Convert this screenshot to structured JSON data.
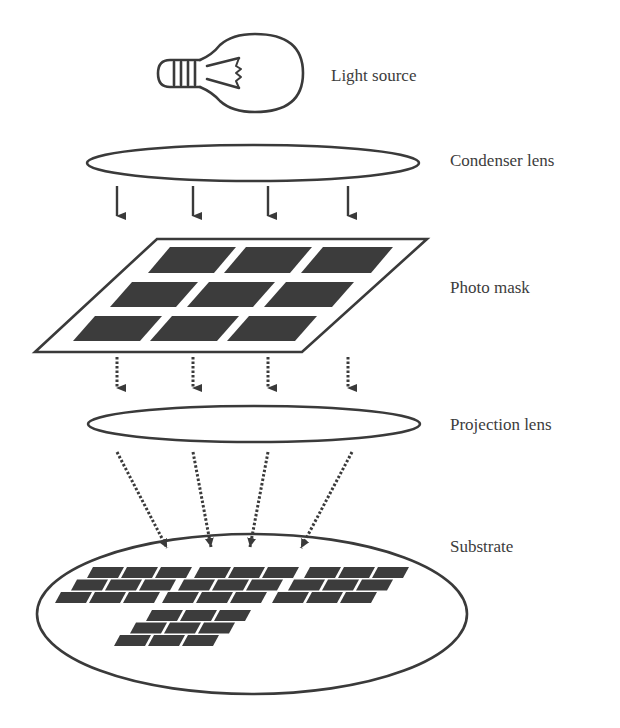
{
  "diagram": {
    "colors": {
      "stroke": "#3a3a3a",
      "die_fill": "#3c3c3c",
      "text": "#3c3c3c",
      "background": "#ffffff"
    },
    "components": [
      {
        "id": "light-source",
        "label": "Light source",
        "label_x": 331,
        "label_y": 67
      },
      {
        "id": "condenser-lens",
        "label": "Condenser lens",
        "label_x": 450,
        "label_y": 152
      },
      {
        "id": "photo-mask",
        "label": "Photo mask",
        "label_x": 450,
        "label_y": 279
      },
      {
        "id": "projection-lens",
        "label": "Projection lens",
        "label_x": 450,
        "label_y": 416
      },
      {
        "id": "substrate",
        "label": "Substrate",
        "label_x": 450,
        "label_y": 538
      }
    ],
    "condenser_lens": {
      "cx": 253,
      "cy": 163,
      "rx": 166,
      "ry": 18
    },
    "projection_lens": {
      "cx": 254,
      "cy": 424,
      "rx": 166,
      "ry": 18
    },
    "substrate_wafer": {
      "cx": 252,
      "cy": 614,
      "rx": 215,
      "ry": 80
    },
    "photo_mask": {
      "outline": [
        [
          157,
          239
        ],
        [
          427,
          239
        ],
        [
          302,
          352
        ],
        [
          35,
          352
        ]
      ],
      "die_rows": 3,
      "die_cols": 3
    },
    "arrows": {
      "solid": {
        "count": 4,
        "x": [
          117,
          193,
          268,
          348
        ],
        "y_start": 186,
        "y_end": 226
      },
      "dotted_straight": {
        "count": 4,
        "x": [
          117,
          193,
          268,
          348
        ],
        "y_start": 357,
        "y_end": 397
      },
      "dotted_converging": [
        {
          "from": [
            117,
            452
          ],
          "to": [
            172,
            557
          ]
        },
        {
          "from": [
            193,
            452
          ],
          "to": [
            213,
            557
          ]
        },
        {
          "from": [
            268,
            452
          ],
          "to": [
            248,
            557
          ]
        },
        {
          "from": [
            352,
            452
          ],
          "to": [
            296,
            557
          ]
        }
      ]
    },
    "wafer_die_groups": [
      {
        "name": "group-1",
        "x0": 93,
        "y0": 567
      },
      {
        "name": "group-2",
        "x0": 200,
        "y0": 567
      },
      {
        "name": "group-3",
        "x0": 310,
        "y0": 567
      },
      {
        "name": "group-4",
        "x0": 152,
        "y0": 610
      }
    ]
  }
}
